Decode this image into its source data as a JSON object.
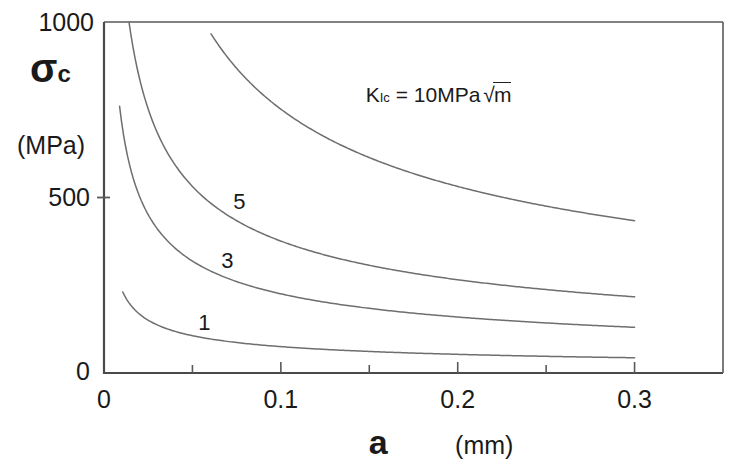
{
  "chart_data": {
    "type": "line",
    "title": "",
    "xlabel": "a",
    "xunit": "(mm)",
    "ylabel": "σ",
    "ylabel_sub": "c",
    "yunit": "(MPa)",
    "xlim": [
      0,
      0.35
    ],
    "ylim": [
      0,
      1000
    ],
    "x_ticks": [
      0,
      0.1,
      0.2,
      0.3
    ],
    "x_tick_labels": [
      "0",
      "0.1",
      "0.2",
      "0.3"
    ],
    "x_minor_ticks": [
      0.05,
      0.15,
      0.25
    ],
    "y_ticks": [
      0,
      500,
      1000
    ],
    "y_tick_labels": [
      "0",
      "500",
      "1000"
    ],
    "grid": false,
    "legend": "inline-curve-labels",
    "annotation": {
      "text_prefix": "K",
      "text_sub": "Ic",
      "text_rest": " = 10MPa",
      "radical": "√",
      "radicand": "m",
      "x": 0.148,
      "y": 790
    },
    "relation": "sigma_c = 23.77 * K / sqrt(a),  a in mm",
    "coefficient": 23.77,
    "series": [
      {
        "name": "K_Ic = 10 MPa√m",
        "K": 10,
        "label": "",
        "label_x": 0,
        "label_y": 0,
        "a_start": 0.0605,
        "a_end": 0.3,
        "points_a": [
          0.0605,
          0.07,
          0.08,
          0.09,
          0.1,
          0.12,
          0.14,
          0.16,
          0.18,
          0.2,
          0.22,
          0.24,
          0.26,
          0.28,
          0.3
        ],
        "points_sigma": [
          966,
          898,
          840,
          792,
          752,
          686,
          635,
          594,
          560,
          531,
          507,
          485,
          466,
          449,
          434
        ]
      },
      {
        "name": "5",
        "K": 5,
        "label": "5",
        "label_x": 0.0765,
        "label_y": 487,
        "a_start": 0.0108,
        "a_end": 0.3,
        "points_a": [
          0.0108,
          0.015,
          0.02,
          0.03,
          0.04,
          0.05,
          0.06,
          0.08,
          0.1,
          0.12,
          0.15,
          0.18,
          0.21,
          0.24,
          0.27,
          0.3
        ],
        "points_sigma": [
          1143,
          970,
          840,
          686,
          594,
          531,
          485,
          420,
          376,
          343,
          307,
          280,
          259,
          243,
          229,
          217
        ]
      },
      {
        "name": "3",
        "K": 3,
        "label": "3",
        "label_x": 0.0697,
        "label_y": 320,
        "a_start": 0.0088,
        "a_end": 0.3,
        "points_a": [
          0.0088,
          0.012,
          0.015,
          0.02,
          0.03,
          0.04,
          0.05,
          0.07,
          0.09,
          0.11,
          0.14,
          0.17,
          0.2,
          0.23,
          0.26,
          0.3
        ],
        "points_sigma": [
          760,
          651,
          582,
          504,
          412,
          357,
          319,
          270,
          238,
          215,
          191,
          173,
          159,
          149,
          140,
          130
        ]
      },
      {
        "name": "1",
        "K": 1,
        "label": "1",
        "label_x": 0.0567,
        "label_y": 143,
        "a_start": 0.0106,
        "a_end": 0.3,
        "points_a": [
          0.0106,
          0.015,
          0.02,
          0.03,
          0.04,
          0.06,
          0.08,
          0.1,
          0.13,
          0.16,
          0.2,
          0.24,
          0.27,
          0.3
        ],
        "points_sigma": [
          231,
          194,
          168,
          137,
          119,
          97,
          84,
          75,
          66,
          59,
          53,
          49,
          46,
          43
        ]
      }
    ]
  },
  "geometry": {
    "plot_left": 104,
    "plot_right": 723,
    "plot_top": 22,
    "plot_bottom": 373
  }
}
